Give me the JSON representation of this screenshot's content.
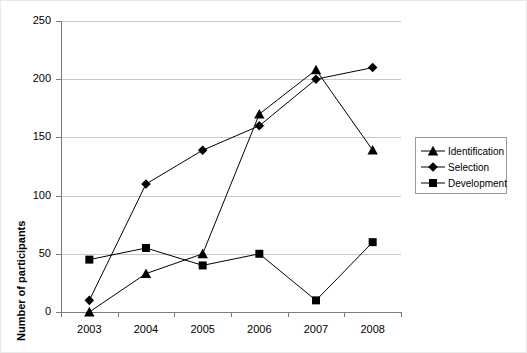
{
  "chart_data": {
    "type": "line",
    "title": "",
    "xlabel": "",
    "ylabel": "Number of participants",
    "categories": [
      "2003",
      "2004",
      "2005",
      "2006",
      "2007",
      "2008"
    ],
    "ylim": [
      0,
      250
    ],
    "ytick_values": [
      0,
      50,
      100,
      150,
      200,
      250
    ],
    "ytick_labels": [
      "0",
      "50",
      "100",
      "150",
      "200",
      "250"
    ],
    "grid": true,
    "legend_position": "right",
    "series": [
      {
        "name": "Identification",
        "marker": "triangle",
        "color": "#000000",
        "values": [
          0,
          33,
          50,
          170,
          208,
          139
        ]
      },
      {
        "name": "Selection",
        "marker": "diamond",
        "color": "#000000",
        "values": [
          10,
          110,
          139,
          160,
          200,
          210
        ]
      },
      {
        "name": "Development",
        "marker": "square",
        "color": "#000000",
        "values": [
          45,
          55,
          40,
          50,
          10,
          60
        ]
      }
    ]
  },
  "axis": {
    "y_title": "Number of participants"
  },
  "legend": {
    "items": [
      {
        "label": "Identification",
        "marker": "triangle-marker-icon"
      },
      {
        "label": "Selection",
        "marker": "diamond-marker-icon"
      },
      {
        "label": "Development",
        "marker": "square-marker-icon"
      }
    ]
  }
}
